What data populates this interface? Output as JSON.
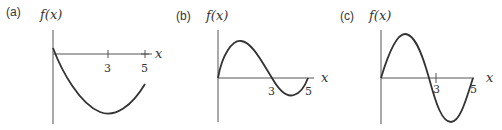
{
  "figure": {
    "panels": [
      {
        "id": "a",
        "label": "(a)",
        "y_axis_label": "f(x)",
        "x_axis_label": "x",
        "ticks": [
          "3",
          "5"
        ],
        "shape": "parabola-like: starts slightly above axis at x=0, crosses down, minimum near x=3, rises toward x=5 but stays below axis"
      },
      {
        "id": "b",
        "label": "(b)",
        "y_axis_label": "f(x)",
        "x_axis_label": "x",
        "ticks": [
          "3",
          "5"
        ],
        "shape": "sine-like: starts at 0, positive hump, crosses axis at x=3, shallow negative dip, returns to 0 at x=5"
      },
      {
        "id": "c",
        "label": "(c)",
        "y_axis_label": "f(x)",
        "x_axis_label": "x",
        "ticks": [
          "3",
          "5"
        ],
        "shape": "sine-like: starts at 0, tall positive hump, crosses axis just before x=3, deep negative trough, returns to 0 at x=5"
      }
    ]
  }
}
